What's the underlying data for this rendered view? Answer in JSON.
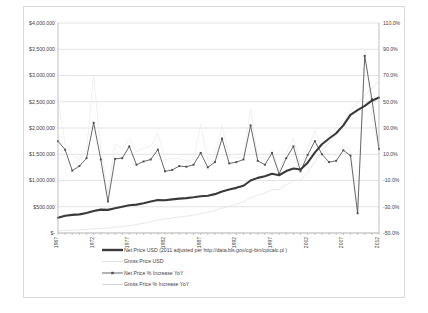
{
  "chart_data": {
    "type": "line",
    "title": "",
    "xlabel": "",
    "ylabel": "",
    "grid": true,
    "legend_position": "bottom",
    "x": [
      1967,
      1968,
      1969,
      1970,
      1971,
      1972,
      1973,
      1974,
      1975,
      1976,
      1977,
      1978,
      1979,
      1980,
      1981,
      1982,
      1983,
      1984,
      1985,
      1986,
      1987,
      1988,
      1989,
      1990,
      1991,
      1992,
      1993,
      1994,
      1995,
      1996,
      1997,
      1998,
      1999,
      2000,
      2001,
      2002,
      2003,
      2004,
      2005,
      2006,
      2007,
      2008,
      2009,
      2010,
      2011,
      2012
    ],
    "xtick_labels": [
      "1967",
      "1972",
      "1977",
      "1982",
      "1987",
      "1992",
      "1997",
      "2002",
      "2007",
      "2012"
    ],
    "xtick_values": [
      1967,
      1972,
      1977,
      1982,
      1987,
      1992,
      1997,
      2002,
      2007,
      2012
    ],
    "left_axis": {
      "label": "",
      "ylim": [
        0,
        4000000
      ],
      "ticks": [
        0,
        500000,
        1000000,
        1500000,
        2000000,
        2500000,
        3000000,
        3500000,
        4000000
      ],
      "tick_labels": [
        "$-",
        "$500,000",
        "$1,000,000",
        "$1,500,000",
        "$2,000,000",
        "$2,500,000",
        "$3,000,000",
        "$3,500,000",
        "$4,000,000"
      ]
    },
    "right_axis": {
      "label": "",
      "ylim": [
        -50,
        110
      ],
      "ticks": [
        -50,
        -30,
        -10,
        10,
        30,
        50,
        70,
        90,
        110
      ],
      "tick_labels": [
        "-50.0%",
        "-30.0%",
        "-10.0%",
        "10.0%",
        "30.0%",
        "50.0%",
        "70.0%",
        "90.0%",
        "110.0%"
      ]
    },
    "series": [
      {
        "name": "Net Price USD (2011 adjusted per http://data.bls.gov/cgi-bin/cpicalc.pl )",
        "axis": "left",
        "color": "#3a3a3a",
        "style": "thick-line",
        "values": [
          290000,
          330000,
          345000,
          355000,
          380000,
          420000,
          445000,
          440000,
          470000,
          500000,
          530000,
          540000,
          565000,
          600000,
          630000,
          625000,
          640000,
          655000,
          665000,
          680000,
          700000,
          710000,
          740000,
          790000,
          830000,
          860000,
          900000,
          1000000,
          1050000,
          1080000,
          1130000,
          1100000,
          1180000,
          1230000,
          1210000,
          1340000,
          1530000,
          1690000,
          1800000,
          1900000,
          2050000,
          2250000,
          2340000,
          2420000,
          2520000,
          2580000
        ]
      },
      {
        "name": "Gross Price USD",
        "axis": "left",
        "color": "#e2e2e2",
        "style": "thin-line",
        "values": [
          40000,
          48000,
          55000,
          60000,
          68000,
          80000,
          90000,
          95000,
          110000,
          125000,
          140000,
          160000,
          185000,
          215000,
          250000,
          265000,
          285000,
          305000,
          320000,
          340000,
          370000,
          390000,
          425000,
          470000,
          510000,
          545000,
          590000,
          670000,
          720000,
          760000,
          820000,
          830000,
          920000,
          1000000,
          1010000,
          1150000,
          1360000,
          1560000,
          1720000,
          1870000,
          2060000,
          2330000,
          2480000,
          2610000,
          2770000,
          2880000
        ]
      },
      {
        "name": "Net Price % Increase YoY",
        "axis": "right",
        "color": "#4d4d4d",
        "style": "line-with-markers",
        "values": [
          20.0,
          13.5,
          -2.5,
          1.0,
          7.0,
          34.0,
          6.0,
          -26.0,
          6.5,
          7.0,
          16.0,
          2.0,
          4.5,
          6.0,
          13.5,
          -3.0,
          -2.0,
          1.0,
          0.5,
          2.0,
          11.0,
          0.0,
          4.0,
          22.0,
          3.0,
          4.0,
          6.0,
          32.0,
          5.0,
          2.0,
          11.0,
          -5.0,
          7.0,
          16.0,
          -3.0,
          9.5,
          20.0,
          10.0,
          4.0,
          5.0,
          13.0,
          9.0,
          -35.0,
          85.0,
          52.0,
          14.0
        ]
      },
      {
        "name": "Gross Price % Increase YoY",
        "axis": "right",
        "color": "#ececec",
        "style": "thin-line",
        "values": [
          52.0,
          18.0,
          10.0,
          6.0,
          12.0,
          70.0,
          14.0,
          -20.0,
          18.0,
          14.0,
          22.0,
          12.0,
          15.0,
          16.0,
          26.0,
          6.0,
          7.0,
          7.0,
          5.0,
          6.0,
          33.0,
          5.0,
          9.0,
          32.0,
          9.0,
          7.0,
          8.0,
          44.0,
          8.0,
          6.0,
          14.0,
          -3.0,
          11.0,
          22.0,
          1.0,
          14.0,
          28.0,
          15.0,
          10.0,
          9.0,
          17.0,
          13.0,
          -30.0,
          90.0,
          40.0,
          12.0
        ]
      }
    ]
  },
  "legend": {
    "items": [
      {
        "label": "Net Price USD (2011 adjusted per http://data.bls.gov/cgi-bin/cpicalc.pl )",
        "marker": "thick-line-swatch",
        "color": "#3a3a3a"
      },
      {
        "label": "Gross Price USD",
        "marker": "thin-line-swatch",
        "color": "#dcdcdc"
      },
      {
        "label": "Net Price % Increase YoY",
        "marker": "line-marker-swatch",
        "color": "#4d4d4d"
      },
      {
        "label": "Gross Price % Increase YoY",
        "marker": "thin-line-swatch",
        "color": "#cfcfcf"
      }
    ]
  }
}
